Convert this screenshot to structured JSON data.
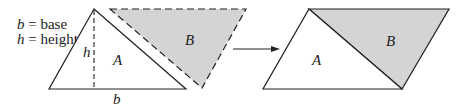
{
  "legend": {
    "line1_var": "b",
    "line1_text": " = base",
    "line2_var": "h",
    "line2_text": " = height"
  },
  "left_figure": {
    "triangle_a_label": "A",
    "height_label": "h",
    "base_label": "b",
    "triangle_b_label": "B"
  },
  "right_figure": {
    "triangle_a_label": "A",
    "triangle_b_label": "B"
  },
  "colors": {
    "shaded_fill": "#d4d4d4",
    "stroke": "#222222"
  }
}
